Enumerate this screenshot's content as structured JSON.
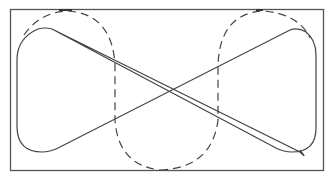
{
  "diagram": {
    "frame": {
      "x": 10,
      "y": 9,
      "width": 313,
      "height": 161,
      "stroke": "#555555"
    },
    "solid_path": {
      "stroke": "#444444",
      "style": "solid"
    },
    "dashed_shapes": [
      {
        "name": "left-dashed-oval",
        "stroke": "#444444",
        "style": "dashed"
      },
      {
        "name": "right-dashed-oval",
        "stroke": "#444444",
        "style": "dashed"
      }
    ],
    "top_marks": [
      {
        "x": 60,
        "y": 9,
        "width": 12
      },
      {
        "x": 256,
        "y": 9,
        "width": 8
      }
    ]
  }
}
